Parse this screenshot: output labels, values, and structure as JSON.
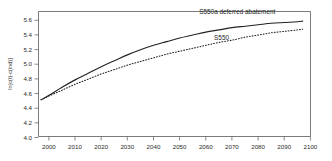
{
  "chart_data": {
    "type": "line",
    "title": "",
    "subtitle": "",
    "xlabel": "",
    "ylabel": "ln[c(t)-c(ind)]",
    "xlim": [
      1996,
      2100
    ],
    "ylim": [
      4.0,
      5.7
    ],
    "grid": false,
    "legend_position": "inline-annotations",
    "xticks": [
      2000,
      2010,
      2020,
      2030,
      2040,
      2050,
      2060,
      2070,
      2080,
      2090,
      2100
    ],
    "xtick_labels": [
      "2000",
      "2010",
      "2020",
      "2030",
      "2040",
      "2050",
      "2060",
      "2070",
      "2080",
      "2090",
      "2100"
    ],
    "yticks": [
      4.0,
      4.2,
      4.4,
      4.6,
      4.8,
      5.0,
      5.2,
      5.4,
      5.6
    ],
    "ytick_labels": [
      "4.0",
      "4.2",
      "4.4",
      "4.6",
      "4.8",
      "5.0",
      "5.2",
      "5.4",
      "5.6"
    ],
    "x": [
      1997,
      2000,
      2005,
      2010,
      2015,
      2020,
      2025,
      2030,
      2035,
      2040,
      2045,
      2050,
      2055,
      2060,
      2065,
      2070,
      2075,
      2080,
      2085,
      2090,
      2095,
      2097
    ],
    "series": [
      {
        "name": "S550a deferred abatement",
        "style": "solid",
        "label": "S550a deferred abatement",
        "values": [
          4.5,
          4.56,
          4.67,
          4.77,
          4.86,
          4.95,
          5.03,
          5.11,
          5.18,
          5.24,
          5.29,
          5.34,
          5.38,
          5.42,
          5.45,
          5.48,
          5.5,
          5.52,
          5.54,
          5.55,
          5.56,
          5.57
        ]
      },
      {
        "name": "S550",
        "style": "dotted",
        "label": "S550",
        "values": [
          4.5,
          4.55,
          4.63,
          4.71,
          4.78,
          4.85,
          4.91,
          4.97,
          5.02,
          5.07,
          5.12,
          5.16,
          5.2,
          5.24,
          5.28,
          5.31,
          5.35,
          5.38,
          5.41,
          5.43,
          5.45,
          5.46
        ]
      }
    ],
    "annotations": [
      {
        "text": "S550a deferred abatement",
        "x": 2072,
        "y": 5.66,
        "anchor": "middle"
      },
      {
        "text": "S550",
        "x": 2066,
        "y": 5.31,
        "anchor": "middle"
      }
    ],
    "colors": {
      "curve": "#222222",
      "axis": "#6b6b6b",
      "background": "#ffffff"
    }
  }
}
